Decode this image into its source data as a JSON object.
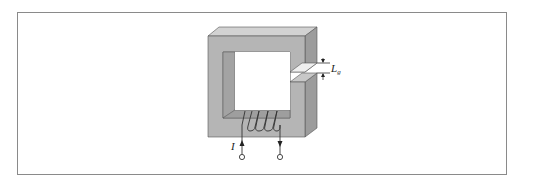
{
  "figure": {
    "labels": {
      "current": "I",
      "gap_main": "L",
      "gap_sub": "g"
    },
    "colors": {
      "core_front": "#b3b3b3",
      "core_top": "#cfcfcf",
      "core_side": "#9a9a9a",
      "inner_shade": "#a6a6a6",
      "line": "#444444",
      "frame": "#8a8a8a"
    }
  }
}
